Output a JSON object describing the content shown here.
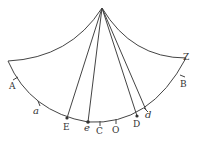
{
  "diagram": {
    "type": "geometric-figure",
    "stroke_color": "#444444",
    "labels": {
      "A": "A",
      "a": "a",
      "E": "E",
      "e": "e",
      "C": "C",
      "O": "O",
      "D": "D",
      "d": "d",
      "B": "B",
      "Z": "Z"
    }
  }
}
